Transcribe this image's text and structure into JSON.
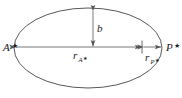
{
  "figure": {
    "kind": "ellipse-orbit-diagram",
    "background_color": "#ffffff",
    "stroke_color": "#3a3a3a",
    "axis_color": "#555555",
    "text_color": "#1a1a1a"
  },
  "labels": {
    "apoapsis_point": "A",
    "apoapsis_star": "★",
    "periapsis_point": "P",
    "periapsis_star": "★",
    "semi_minor_axis": "b",
    "apoapsis_radius_symbol": "r",
    "apoapsis_radius_subscript": "A",
    "apoapsis_radius_subscript_star": "★",
    "periapsis_radius_symbol": "r",
    "periapsis_radius_subscript": "P",
    "periapsis_radius_subscript_star": "★"
  },
  "geometry": {
    "ellipse_center_x": 88,
    "ellipse_center_y": 48,
    "ellipse_radius_x": 74,
    "ellipse_radius_y": 40,
    "major_axis_y": 47,
    "focus_x": 142,
    "semi_minor_arrow_x": 93,
    "semi_minor_arrow_top_y": 10,
    "left_vertex_x": 14,
    "right_vertex_x": 162
  },
  "annotations": {
    "semi_minor_axis_description": "Vertical double-headed arrow marking semi-minor axis b",
    "apoapsis_radius_description": "Horizontal double-headed arrow from left vertex to focus",
    "periapsis_radius_description": "Horizontal double-headed arrow from focus to right vertex"
  }
}
